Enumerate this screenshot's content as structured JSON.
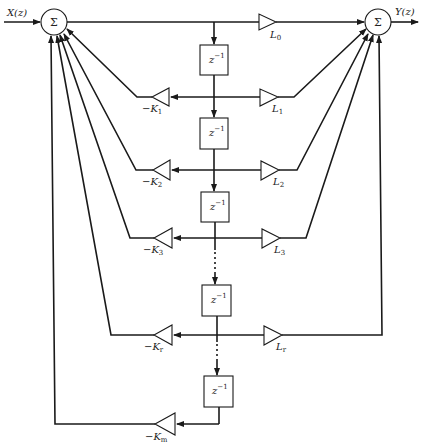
{
  "diagram": {
    "type": "lattice-ladder filter block diagram",
    "input_label": "X(z)",
    "output_label": "Y(z)",
    "left_summer": {
      "symbol": "Σ"
    },
    "right_summer": {
      "symbol": "Σ"
    },
    "delay_label": "z",
    "delay_exp": "−1",
    "top_gain": {
      "label": "L",
      "sub": "0"
    },
    "stages": [
      {
        "k_label": "−K",
        "k_sub": "1",
        "l_label": "L",
        "l_sub": "1"
      },
      {
        "k_label": "−K",
        "k_sub": "2",
        "l_label": "L",
        "l_sub": "2"
      },
      {
        "k_label": "−K",
        "k_sub": "3",
        "l_label": "L",
        "l_sub": "3"
      },
      {
        "k_label": "−K",
        "k_sub": "r",
        "l_label": "L",
        "l_sub": "r"
      }
    ],
    "final_gain": {
      "label": "−K",
      "sub": "m"
    },
    "ellipsis": "⋮",
    "colors": {
      "stroke": "#1a1a1a",
      "background": "#ffffff"
    }
  }
}
